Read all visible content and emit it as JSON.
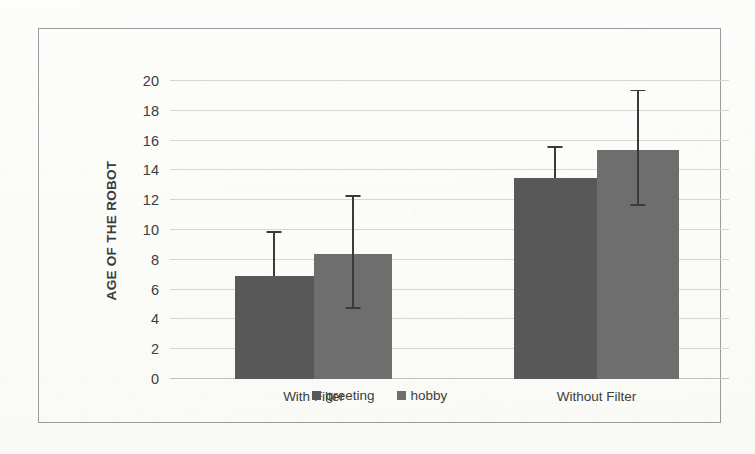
{
  "chart_data": {
    "type": "bar",
    "title": "",
    "subtitle": "",
    "xlabel": "",
    "ylabel": "AGE OF THE ROBOT",
    "categories": [
      "With Filter",
      "Without Filter"
    ],
    "series": [
      {
        "name": "greeting",
        "color": "#585858",
        "values": [
          6.9,
          13.5
        ],
        "errors_upper": [
          9.8,
          15.5
        ],
        "errors_lower": [
          6.9,
          13.5
        ]
      },
      {
        "name": "hobby",
        "color": "#6e6e6e",
        "values": [
          8.4,
          15.4
        ],
        "errors_upper": [
          12.2,
          19.3
        ],
        "errors_lower": [
          4.7,
          11.6
        ]
      }
    ],
    "ylim": [
      0,
      20
    ],
    "ytick_step": 2,
    "yticks": [
      "0",
      "2",
      "4",
      "6",
      "8",
      "10",
      "12",
      "14",
      "16",
      "18",
      "20"
    ],
    "grid": true,
    "legend_position": "bottom-center"
  },
  "frame": {
    "border_color": "#9a9a9a"
  },
  "legend": {
    "items": [
      {
        "label": "greeting",
        "color": "#585858"
      },
      {
        "label": "hobby",
        "color": "#6e6e6e"
      }
    ]
  }
}
